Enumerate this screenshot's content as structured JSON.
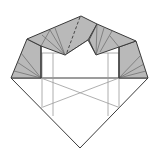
{
  "diagram": {
    "type": "origami-fold-diagram",
    "colors": {
      "background": "#ffffff",
      "flap_fill": "#b9b9b9",
      "outline": "#3a3a3a",
      "crease": "#8a8a8a"
    },
    "elements": [
      "top-left-flap",
      "top-right-flap",
      "left-side-flap",
      "right-side-flap",
      "valley-fold-dashed-line",
      "center-notch",
      "lower-diamond-body",
      "crease-lines"
    ]
  }
}
